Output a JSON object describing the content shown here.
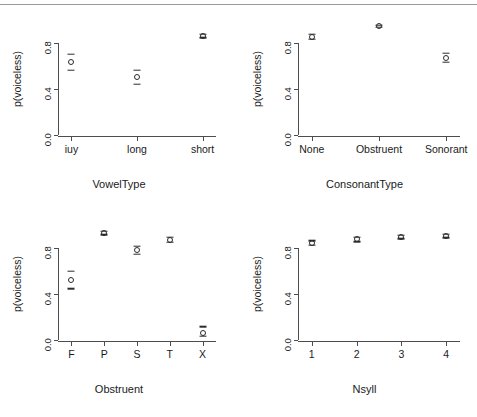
{
  "figure": {
    "background": "#ffffff",
    "ink": "#2b2b2b",
    "axis_color": "#4d4d4d",
    "rule_color": "#9a9a9a",
    "ylabel": "p(voiceless)",
    "ytick_labels": [
      "0.0",
      "0.4",
      "0.8"
    ],
    "ytick_values": [
      0.0,
      0.4,
      0.8
    ],
    "ylim": [
      -0.02,
      1.0
    ]
  },
  "chart_data": [
    {
      "type": "scatter",
      "title": "",
      "xlabel": "VowelType",
      "ylabel": "p(voiceless)",
      "categories": [
        "iuy",
        "long",
        "short"
      ],
      "values": [
        0.63,
        0.5,
        0.86
      ],
      "lower": [
        0.56,
        0.44,
        0.845
      ],
      "upper": [
        0.7,
        0.56,
        0.875
      ],
      "ylim": [
        -0.02,
        1.0
      ],
      "yticks": [
        0.0,
        0.4,
        0.8
      ],
      "grid": false,
      "legend": "none"
    },
    {
      "type": "scatter",
      "title": "",
      "xlabel": "ConsonantType",
      "ylabel": "p(voiceless)",
      "categories": [
        "None",
        "Obstruent",
        "Sonorant"
      ],
      "values": [
        0.855,
        0.945,
        0.67
      ],
      "lower": [
        0.835,
        0.935,
        0.63
      ],
      "upper": [
        0.875,
        0.955,
        0.71
      ],
      "ylim": [
        -0.02,
        1.0
      ],
      "yticks": [
        0.0,
        0.4,
        0.8
      ],
      "grid": false,
      "legend": "none"
    },
    {
      "type": "scatter",
      "title": "",
      "xlabel": "Obstruent",
      "ylabel": "p(voiceless)",
      "categories": [
        "F",
        "P",
        "S",
        "T",
        "X"
      ],
      "values": [
        0.52,
        0.93,
        0.78,
        0.87,
        0.055
      ],
      "lower": [
        0.445,
        0.915,
        0.745,
        0.85,
        0.03
      ],
      "upper": [
        0.6,
        0.945,
        0.815,
        0.895,
        0.115
      ],
      "ylim": [
        -0.02,
        1.0
      ],
      "yticks": [
        0.0,
        0.4,
        0.8
      ],
      "grid": false,
      "legend": "none"
    },
    {
      "type": "scatter",
      "title": "",
      "xlabel": "Nsyll",
      "ylabel": "p(voiceless)",
      "categories": [
        "1",
        "2",
        "3",
        "4"
      ],
      "values": [
        0.845,
        0.875,
        0.895,
        0.905
      ],
      "lower": [
        0.825,
        0.855,
        0.88,
        0.89
      ],
      "upper": [
        0.865,
        0.895,
        0.91,
        0.92
      ],
      "ylim": [
        -0.02,
        1.0
      ],
      "yticks": [
        0.0,
        0.4,
        0.8
      ],
      "grid": false,
      "legend": "none"
    }
  ]
}
